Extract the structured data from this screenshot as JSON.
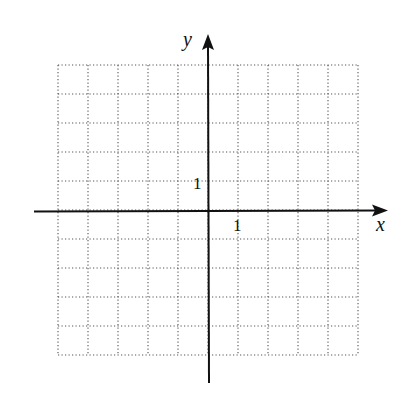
{
  "diagram": {
    "type": "coordinate-grid",
    "grid": {
      "x_min": -5,
      "x_max": 5,
      "y_min": -5,
      "y_max": 5,
      "cells_x": 10,
      "cells_y": 10,
      "line_style": "dotted",
      "line_color": "#555555"
    },
    "axes": {
      "x_label": "x",
      "y_label": "y",
      "x_tick_label": "1",
      "y_tick_label": "1",
      "color": "#111111"
    }
  },
  "chart_data": {
    "type": "grid",
    "title": "",
    "xlabel": "x",
    "ylabel": "y",
    "xlim": [
      -5,
      5
    ],
    "ylim": [
      -5,
      5
    ],
    "grid": true,
    "annotations": [
      {
        "text": "1",
        "at": "x-axis tick x=1"
      },
      {
        "text": "1",
        "at": "y-axis tick y=1"
      }
    ]
  }
}
